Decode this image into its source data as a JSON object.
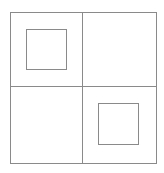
{
  "diagram": {
    "stroke_color": "#8a8a8a",
    "outer_square": {
      "x": 10.5,
      "y": 12.5,
      "w": 146,
      "h": 151
    },
    "divider_vertical": {
      "x": 82.5,
      "y1": 12.5,
      "y2": 163.5
    },
    "divider_horizontal": {
      "y": 86.5,
      "x1": 10.5,
      "x2": 156.5
    },
    "inner_squares": [
      {
        "quadrant": "top-left",
        "x": 26.5,
        "y": 29.5,
        "w": 40,
        "h": 40
      },
      {
        "quadrant": "bottom-right",
        "x": 98.5,
        "y": 103.5,
        "w": 40,
        "h": 41
      }
    ]
  }
}
